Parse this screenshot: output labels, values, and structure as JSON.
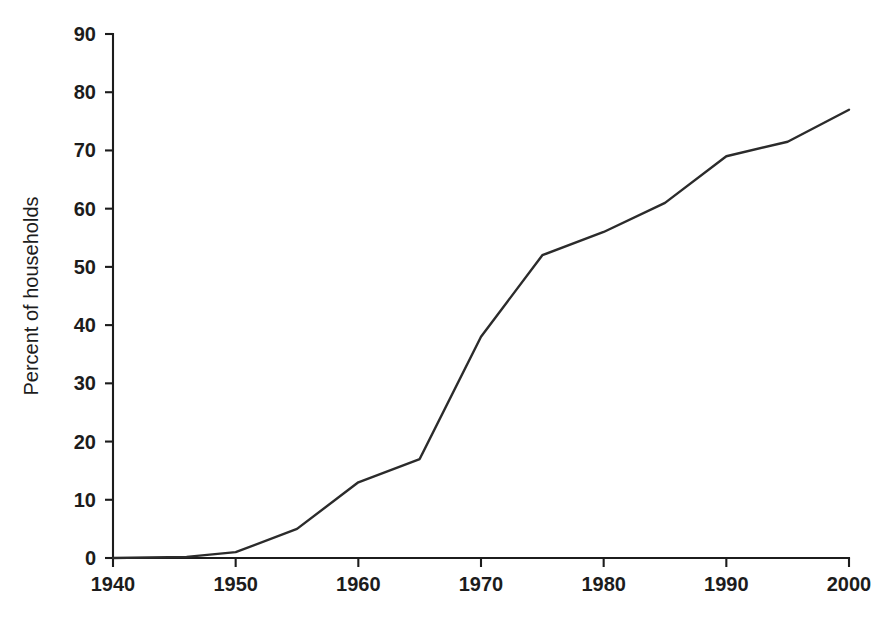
{
  "chart_data": {
    "type": "line",
    "title": "",
    "xlabel": "",
    "ylabel": "Percent of households",
    "xlim": [
      1940,
      2000
    ],
    "ylim": [
      0,
      90
    ],
    "grid": false,
    "legend": false,
    "legend_position": "none",
    "line_color": "#2b2b2b",
    "x": [
      1940,
      1946,
      1950,
      1955,
      1960,
      1965,
      1970,
      1975,
      1980,
      1985,
      1990,
      1995,
      2000
    ],
    "values": [
      0,
      0.2,
      1,
      5,
      13,
      17,
      38,
      52,
      56,
      61,
      69,
      71.5,
      77
    ],
    "series": [
      {
        "name": "Percent of households",
        "values": [
          0,
          0.2,
          1,
          5,
          13,
          17,
          38,
          52,
          56,
          61,
          69,
          71.5,
          77
        ]
      }
    ],
    "xticks": [
      1940,
      1950,
      1960,
      1970,
      1980,
      1990,
      2000
    ],
    "xtick_labels": [
      "1940",
      "1950",
      "1960",
      "1970",
      "1980",
      "1990",
      "2000"
    ],
    "yticks": [
      0,
      10,
      20,
      30,
      40,
      50,
      60,
      70,
      80,
      90
    ],
    "ytick_labels": [
      "0",
      "10",
      "20",
      "30",
      "40",
      "50",
      "60",
      "70",
      "80",
      "90"
    ]
  },
  "caption": {
    "ghost_text": ""
  }
}
